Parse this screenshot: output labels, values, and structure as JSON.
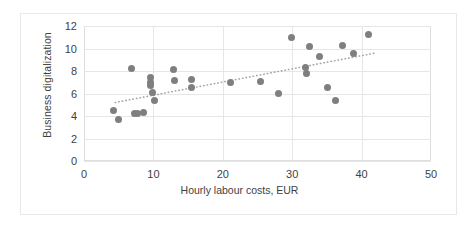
{
  "chart_data": {
    "type": "scatter",
    "title": "",
    "xlabel": "Hourly labour costs, EUR",
    "ylabel": "Business digitalization",
    "xlim": [
      0,
      50
    ],
    "ylim": [
      0,
      12
    ],
    "xticks": [
      0,
      10,
      20,
      30,
      40,
      50
    ],
    "yticks": [
      0,
      2,
      4,
      6,
      8,
      10,
      12
    ],
    "grid": true,
    "legend": false,
    "marker_color": "#7f7f7f",
    "trendline_color": "#a6a6a6",
    "trendline_style": "dotted",
    "points": [
      {
        "x": 4.2,
        "y": 4.5
      },
      {
        "x": 5.0,
        "y": 3.7
      },
      {
        "x": 6.8,
        "y": 8.25
      },
      {
        "x": 7.3,
        "y": 4.25
      },
      {
        "x": 7.7,
        "y": 4.25
      },
      {
        "x": 8.6,
        "y": 4.3
      },
      {
        "x": 9.6,
        "y": 7.4
      },
      {
        "x": 9.6,
        "y": 7.0
      },
      {
        "x": 9.6,
        "y": 6.75
      },
      {
        "x": 9.9,
        "y": 6.05
      },
      {
        "x": 10.1,
        "y": 5.4
      },
      {
        "x": 12.9,
        "y": 8.1
      },
      {
        "x": 13.0,
        "y": 7.2
      },
      {
        "x": 15.5,
        "y": 7.25
      },
      {
        "x": 15.5,
        "y": 6.55
      },
      {
        "x": 21.1,
        "y": 6.95
      },
      {
        "x": 25.4,
        "y": 7.05
      },
      {
        "x": 28.0,
        "y": 6.0
      },
      {
        "x": 29.9,
        "y": 10.95
      },
      {
        "x": 31.9,
        "y": 8.35
      },
      {
        "x": 32.1,
        "y": 7.8
      },
      {
        "x": 32.5,
        "y": 10.2
      },
      {
        "x": 34.0,
        "y": 9.3
      },
      {
        "x": 35.1,
        "y": 6.5
      },
      {
        "x": 36.2,
        "y": 5.4
      },
      {
        "x": 37.2,
        "y": 10.25
      },
      {
        "x": 38.8,
        "y": 9.6
      },
      {
        "x": 41.0,
        "y": 11.25
      }
    ],
    "trendline": {
      "x1": 4.5,
      "y1": 5.2,
      "x2": 42.0,
      "y2": 9.6
    }
  }
}
